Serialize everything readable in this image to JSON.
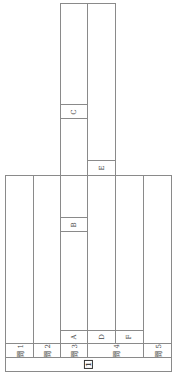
{
  "section": {
    "number": "1"
  },
  "questions": [
    {
      "label": "問",
      "num": "1"
    },
    {
      "label": "問",
      "num": "2"
    },
    {
      "label": "問",
      "num": "3"
    },
    {
      "label": "問",
      "num": "4"
    },
    {
      "label": "問",
      "num": "5"
    }
  ],
  "subparts": {
    "A": "A",
    "B": "B",
    "C": "C",
    "D": "D",
    "E": "E",
    "F": "F"
  }
}
